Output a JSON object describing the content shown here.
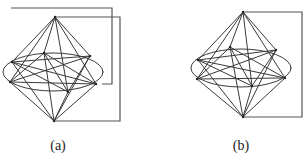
{
  "figures": [
    {
      "id": "a",
      "caption": "(a)",
      "caption_x": 58,
      "description": "Double cone (bipyramid) over an ellipse with two offset frames behind it",
      "apex_top": [
        55,
        17
      ],
      "apex_bottom": [
        54,
        121
      ],
      "ellipse": {
        "cx": 53,
        "cy": 72,
        "rx": 50,
        "ry": 19
      },
      "equator_vertices": [
        [
          12,
          62
        ],
        [
          10,
          82
        ],
        [
          44,
          53
        ],
        [
          90,
          56
        ],
        [
          96,
          84
        ],
        [
          68,
          92
        ]
      ],
      "frames": [
        {
          "points": "11,8 112,8 112,84 102,84"
        },
        {
          "points": "55,17 120,17 120,121 54,121"
        }
      ]
    },
    {
      "id": "b",
      "caption": "(b)",
      "caption_x": 241,
      "description": "Double cone (bipyramid) over an ellipse with a single frame on the right",
      "apex_top": [
        243,
        12
      ],
      "apex_bottom": [
        243,
        117
      ],
      "ellipse": {
        "cx": 241,
        "cy": 68,
        "rx": 50,
        "ry": 19
      },
      "equator_vertices": [
        [
          198,
          60
        ],
        [
          197,
          79
        ],
        [
          230,
          47
        ],
        [
          276,
          50
        ],
        [
          285,
          78
        ],
        [
          252,
          86
        ]
      ],
      "frames": [
        {
          "points": "243,12 302,12 302,117 243,117"
        }
      ]
    }
  ],
  "colors": {
    "line": "#3a3a3a",
    "frame": "#555555",
    "background": "#ffffff"
  }
}
